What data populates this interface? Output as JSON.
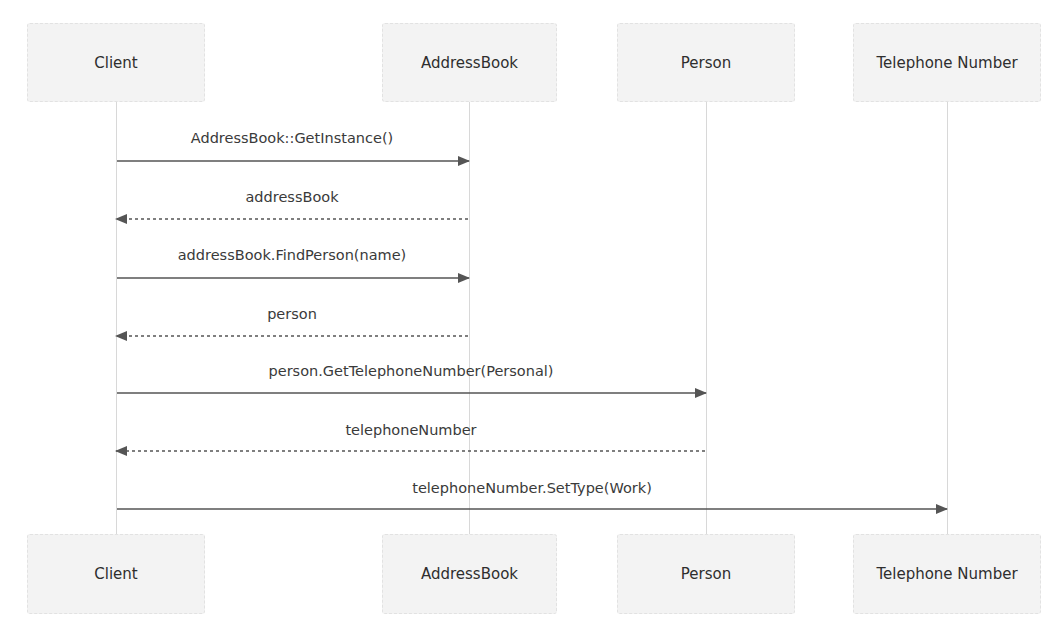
{
  "diagram": {
    "type": "sequence",
    "participants": [
      {
        "id": "client",
        "label": "Client",
        "x": 116,
        "box_left": 27,
        "box_width": 178
      },
      {
        "id": "addressbook",
        "label": "AddressBook",
        "x": 469,
        "box_left": 382,
        "box_width": 175
      },
      {
        "id": "person",
        "label": "Person",
        "x": 706,
        "box_left": 617,
        "box_width": 178
      },
      {
        "id": "telephone",
        "label": "Telephone Number",
        "x": 947,
        "box_left": 853,
        "box_width": 188
      }
    ],
    "messages": [
      {
        "from": "client",
        "to": "addressbook",
        "label": "AddressBook::GetInstance()",
        "style": "solid",
        "y": 161
      },
      {
        "from": "addressbook",
        "to": "client",
        "label": "addressBook",
        "style": "dashed",
        "y": 219
      },
      {
        "from": "client",
        "to": "addressbook",
        "label": "addressBook.FindPerson(name)",
        "style": "solid",
        "y": 278
      },
      {
        "from": "addressbook",
        "to": "client",
        "label": "person",
        "style": "dashed",
        "y": 336
      },
      {
        "from": "client",
        "to": "person",
        "label": "person.GetTelephoneNumber(Personal)",
        "style": "solid",
        "y": 393
      },
      {
        "from": "person",
        "to": "client",
        "label": "telephoneNumber",
        "style": "dashed",
        "y": 451
      },
      {
        "from": "client",
        "to": "telephone",
        "label": "telephoneNumber.SetType(Work)",
        "style": "solid",
        "y": 509
      }
    ],
    "colors": {
      "box_fill": "#f3f3f3",
      "box_border": "#e2e2e2",
      "lifeline": "#d8d8d8",
      "arrow": "#555555",
      "text": "#333333"
    }
  }
}
